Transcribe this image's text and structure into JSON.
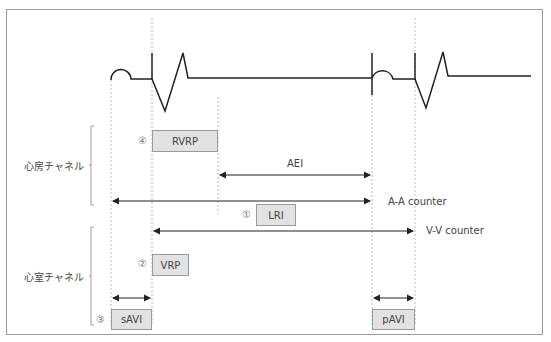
{
  "diagram": {
    "type": "pacemaker-timing-diagram",
    "channels": {
      "atrial": "心房チャネル",
      "ventricular": "心室チャネル"
    },
    "intervals": {
      "rvrp": {
        "num": "④",
        "label": "RVRP"
      },
      "aei": {
        "label": "AEI"
      },
      "aa_counter": {
        "label": "A-A counter"
      },
      "lri": {
        "num": "①",
        "label": "LRI"
      },
      "vv_counter": {
        "label": "V-V counter"
      },
      "vrp": {
        "num": "②",
        "label": "VRP"
      },
      "savi": {
        "num": "③",
        "label": "sAVI"
      },
      "pavi": {
        "label": "pAVI"
      }
    }
  }
}
